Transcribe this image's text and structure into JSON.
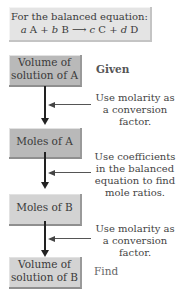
{
  "equation_box": {
    "line1": "For the balanced equation:",
    "a": "a",
    "A": "A",
    "plus1": "+",
    "b": "b",
    "B": "B",
    "arrow": "⟶",
    "c": "c",
    "C": "C",
    "plus2": "+",
    "d": "d",
    "D": "D"
  },
  "boxes": [
    {
      "line1": "Volume of",
      "line2": "solution of A"
    },
    {
      "line1": "Moles of A"
    },
    {
      "line1": "Moles of B"
    },
    {
      "line1": "Volume of",
      "line2": "solution of B"
    }
  ],
  "labels": {
    "given": "Given",
    "find": "Find"
  },
  "notes": [
    {
      "l1": "Use molarity as",
      "l2": "a conversion",
      "l3": "factor."
    },
    {
      "l1": "Use coefficients",
      "l2": "in the balanced",
      "l3": "equation to find",
      "l4": "mole ratios."
    },
    {
      "l1": "Use molarity as",
      "l2": "a conversion",
      "l3": "factor."
    }
  ],
  "colors": {
    "box_dark": "#b9b9b9",
    "box_light": "#d3d3d3",
    "equation_bg": "#e4e4e4"
  }
}
